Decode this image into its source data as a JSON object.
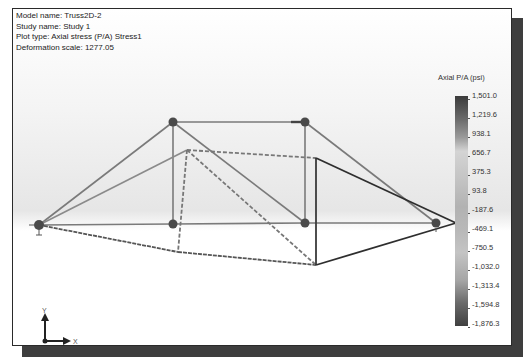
{
  "info": {
    "model_name": "Model name: Truss2D-2",
    "study_name": "Study name: Study 1",
    "plot_type": "Plot type: Axial stress (P/A) Stress1",
    "deformation_scale": "Deformation scale: 1277.05"
  },
  "legend": {
    "title": "Axial P/A (psi)",
    "ticks": [
      "1,501.0",
      "1,219.6",
      "938.1",
      "656.7",
      "375.3",
      "93.8",
      "-187.6",
      "-469.1",
      "-750.5",
      "-1,032.0",
      "-1,313.4",
      "-1,594.8",
      "-1,876.3"
    ],
    "max_color": "#3b3b3b",
    "min_color": "#404040"
  },
  "triad": {
    "x_label": "X",
    "y_label": "Y"
  },
  "colors": {
    "frame_border": "#2a2a2a",
    "shadow": "#3e3e3e",
    "member": "#6e6e6e",
    "node": "#4a4a4a"
  }
}
